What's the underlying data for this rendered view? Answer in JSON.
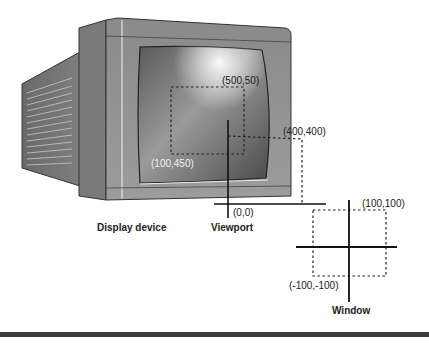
{
  "diagram": {
    "captions": {
      "display_device": "Display device",
      "viewport": "Viewport",
      "window": "Window"
    },
    "viewport_labels": {
      "top_right": "(500,50)",
      "bottom_left": "(100,450)",
      "origin": "(0,0)",
      "corner": "(400,400)"
    },
    "window_labels": {
      "top_right": "(100,100)",
      "bottom_left": "(-100,-100)"
    }
  }
}
